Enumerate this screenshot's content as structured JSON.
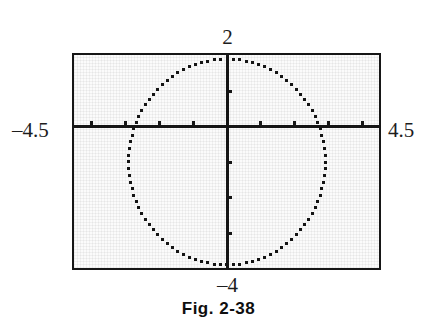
{
  "figure": {
    "caption": "Fig. 2-38",
    "window_labels": {
      "xmin": "–4.5",
      "xmax": "4.5",
      "ymax": "2",
      "ymin": "–4"
    }
  },
  "chart_data": {
    "type": "scatter",
    "title": "Fig. 2-38",
    "subtitle": "",
    "xlabel": "",
    "ylabel": "",
    "render_style": "graphing-calculator pixelated plot, black dotted curve on light screen",
    "grid": false,
    "legend": null,
    "xlim": [
      -4.5,
      4.5
    ],
    "ylim": [
      -4,
      2
    ],
    "xtick_step": 1,
    "ytick_step": 1,
    "xticks": [
      -4,
      -3,
      -2,
      -1,
      0,
      1,
      2,
      3,
      4
    ],
    "yticks": [
      -3,
      -2,
      -1,
      0,
      1
    ],
    "xtick_labels": [
      "",
      "",
      "",
      "",
      "",
      "",
      "",
      "",
      ""
    ],
    "ytick_labels": [
      "",
      "",
      "",
      "",
      ""
    ],
    "axes_drawn": {
      "x_axis_at_y": 0,
      "y_axis_at_x": 0
    },
    "series": [
      {
        "name": "circle",
        "type": "implicit_curve",
        "equation": "x^2 + (y + 1)^2 = 2.9^2",
        "center": [
          0.0,
          -1.0
        ],
        "radius": 2.9,
        "point_count": 96,
        "marker": "square",
        "marker_size": 3,
        "color": "#151515"
      }
    ],
    "annotations": [
      {
        "text": "2",
        "position": "above-frame-at-x0",
        "meaning": "window y-maximum"
      },
      {
        "text": "–4",
        "position": "below-frame-at-x0",
        "meaning": "window y-minimum"
      },
      {
        "text": "–4.5",
        "position": "left-of-frame-at-y0",
        "meaning": "window x-minimum"
      },
      {
        "text": "4.5",
        "position": "right-of-frame-at-y0",
        "meaning": "window x-maximum"
      }
    ]
  },
  "colors": {
    "page_background": "#ffffff",
    "screen_background": "#fbfbfb",
    "frame": "#161616",
    "curve": "#151515",
    "text": "#1a1a1a"
  }
}
